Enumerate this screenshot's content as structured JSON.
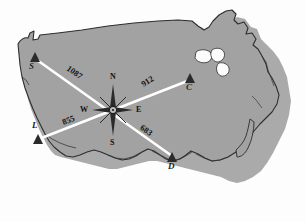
{
  "figure": {
    "kind": "us-map-distance-diagram",
    "map_fill": "#a0a0a0",
    "map_stroke": "#2b2b2b",
    "map_shadow": "#8a8a8a",
    "route_color": "#ffffff",
    "background": "#fdfdfd"
  },
  "cities": [
    {
      "id": "S",
      "label": "S",
      "marker": "triangle-marker",
      "x": 35,
      "y": 58,
      "label_x": 30,
      "label_y": 66
    },
    {
      "id": "C",
      "label": "C",
      "marker": "triangle-marker",
      "x": 190,
      "y": 79,
      "label_x": 187,
      "label_y": 87
    },
    {
      "id": "L",
      "label": "L",
      "marker": "triangle-marker",
      "x": 38,
      "y": 140,
      "label_x": 33,
      "label_y": 127
    },
    {
      "id": "D",
      "label": "D",
      "marker": "triangle-marker",
      "x": 172,
      "y": 158,
      "label_x": 169,
      "label_y": 168
    }
  ],
  "hub": {
    "name": "compass-rose",
    "x": 113,
    "y": 110
  },
  "routes": [
    {
      "from": "S",
      "to": "hub",
      "distance": "1087",
      "label_x": 76,
      "label_y": 75,
      "rotate": -38
    },
    {
      "from": "hub",
      "to": "C",
      "distance": "912",
      "label_x": 148,
      "label_y": 81,
      "rotate": -34
    },
    {
      "from": "L",
      "to": "hub",
      "distance": "855",
      "label_x": 68,
      "label_y": 120,
      "rotate": -20
    },
    {
      "from": "hub",
      "to": "D",
      "distance": "683",
      "label_x": 147,
      "label_y": 131,
      "rotate": 42
    }
  ],
  "compass": {
    "north": "N",
    "south": "S",
    "east": "E",
    "west": "W",
    "n_x": 111,
    "n_y": 76,
    "s_x": 111,
    "s_y": 143,
    "e_x": 137,
    "e_y": 106,
    "w_x": 86,
    "w_y": 106
  }
}
